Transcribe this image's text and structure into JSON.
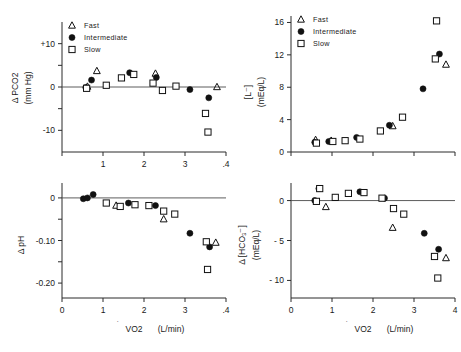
{
  "figure": {
    "title": "",
    "legend": [
      {
        "label": "Fast",
        "marker": "triangle-open"
      },
      {
        "label": "Intermediate",
        "marker": "circle-filled"
      },
      {
        "label": "Slow",
        "marker": "square-open"
      }
    ],
    "xlabel_main": "VO2",
    "xlabel_units": "(L/min)"
  },
  "chart_data": [
    {
      "id": "pco2",
      "type": "scatter",
      "title": "",
      "xlabel": "VO2 (L/min)",
      "ylabel": "Δ PCO2  (mm Hg)",
      "xlim": [
        0,
        4
      ],
      "ylim": [
        -15,
        15
      ],
      "xticks": [
        0,
        1,
        2,
        3,
        4
      ],
      "xticklabels": [
        "",
        "1",
        "2",
        "3",
        ".4"
      ],
      "yticks": [
        -10,
        -5,
        0,
        5,
        10
      ],
      "yticklabels": [
        "-10",
        "",
        "0",
        "",
        "+10"
      ],
      "grid": false,
      "zero_reference_line": 0,
      "legend_position": "top-left",
      "series": [
        {
          "name": "Fast",
          "marker": "triangle-open",
          "points": [
            [
              0.62,
              0.1
            ],
            [
              0.85,
              3.7
            ],
            [
              2.28,
              3.1
            ],
            [
              3.78,
              0.0
            ]
          ]
        },
        {
          "name": "Intermediate",
          "marker": "circle-filled",
          "points": [
            [
              0.58,
              -0.1
            ],
            [
              0.72,
              1.6
            ],
            [
              1.65,
              3.3
            ],
            [
              2.3,
              2.2
            ],
            [
              3.12,
              -0.6
            ],
            [
              3.58,
              -2.5
            ]
          ]
        },
        {
          "name": "Slow",
          "marker": "square-open",
          "points": [
            [
              0.6,
              -0.3
            ],
            [
              1.08,
              0.4
            ],
            [
              1.45,
              2.1
            ],
            [
              1.75,
              2.9
            ],
            [
              2.22,
              0.9
            ],
            [
              2.45,
              -0.8
            ],
            [
              2.78,
              0.2
            ],
            [
              3.5,
              -6.1
            ],
            [
              3.56,
              -10.4
            ]
          ]
        }
      ]
    },
    {
      "id": "lactate",
      "type": "scatter",
      "title": "",
      "xlabel": "VO2 (L/min)",
      "ylabel": "[L⁻]  (mEq/L)",
      "xlim": [
        0,
        4
      ],
      "ylim": [
        0,
        16.8
      ],
      "xticks": [
        0,
        1,
        2,
        3,
        4
      ],
      "xticklabels": [
        "",
        "",
        "",
        "",
        ""
      ],
      "yticks": [
        0,
        4,
        8,
        12,
        16
      ],
      "yticklabels": [
        "0",
        "4",
        "8",
        "12",
        "16"
      ],
      "grid": false,
      "legend_position": "top-left",
      "series": [
        {
          "name": "Fast",
          "marker": "triangle-open",
          "points": [
            [
              0.6,
              1.5
            ],
            [
              0.98,
              1.4
            ],
            [
              2.48,
              3.2
            ],
            [
              3.78,
              10.8
            ]
          ]
        },
        {
          "name": "Intermediate",
          "marker": "circle-filled",
          "points": [
            [
              0.58,
              1.2
            ],
            [
              0.92,
              1.3
            ],
            [
              1.6,
              1.8
            ],
            [
              2.4,
              3.3
            ],
            [
              3.22,
              7.8
            ],
            [
              3.62,
              12.1
            ]
          ]
        },
        {
          "name": "Slow",
          "marker": "square-open",
          "points": [
            [
              0.62,
              1.1
            ],
            [
              1.02,
              1.3
            ],
            [
              1.32,
              1.4
            ],
            [
              1.68,
              1.6
            ],
            [
              2.18,
              2.6
            ],
            [
              2.72,
              4.3
            ],
            [
              3.52,
              11.5
            ],
            [
              3.55,
              16.2
            ]
          ]
        }
      ]
    },
    {
      "id": "ph",
      "type": "scatter",
      "title": "",
      "xlabel": "VO2 (L/min)",
      "ylabel": "Δ pH",
      "xlim": [
        0,
        4
      ],
      "ylim": [
        -0.235,
        0.035
      ],
      "xticks": [
        0,
        1,
        2,
        3,
        4
      ],
      "xticklabels": [
        "0",
        "1",
        "2",
        "3",
        ".4"
      ],
      "yticks": [
        -0.2,
        -0.15,
        -0.1,
        -0.05,
        0
      ],
      "yticklabels": [
        "-0.20",
        "",
        "-0.10",
        "",
        "0"
      ],
      "grid": false,
      "zero_reference_line": 0,
      "series": [
        {
          "name": "Fast",
          "marker": "triangle-open",
          "points": [
            [
              1.32,
              -0.018
            ],
            [
              2.48,
              -0.05
            ],
            [
              3.75,
              -0.105
            ]
          ]
        },
        {
          "name": "Intermediate",
          "marker": "circle-filled",
          "points": [
            [
              0.52,
              -0.002
            ],
            [
              0.62,
              0.0
            ],
            [
              0.76,
              0.008
            ],
            [
              1.62,
              -0.012
            ],
            [
              2.28,
              -0.018
            ],
            [
              3.12,
              -0.083
            ],
            [
              3.6,
              -0.115
            ]
          ]
        },
        {
          "name": "Slow",
          "marker": "square-open",
          "points": [
            [
              1.08,
              -0.012
            ],
            [
              1.42,
              -0.02
            ],
            [
              1.78,
              -0.016
            ],
            [
              2.12,
              -0.018
            ],
            [
              2.48,
              -0.031
            ],
            [
              2.75,
              -0.038
            ],
            [
              3.52,
              -0.103
            ],
            [
              3.55,
              -0.168
            ]
          ]
        }
      ]
    },
    {
      "id": "hco3",
      "type": "scatter",
      "title": "",
      "xlabel": "VO2 (L/min)",
      "ylabel": "Δ [HCO₃⁻]  (mEq/L)",
      "xlim": [
        0,
        4
      ],
      "ylim": [
        -12.2,
        2.2
      ],
      "xticks": [
        0,
        1,
        2,
        3,
        4
      ],
      "xticklabels": [
        "0",
        "1",
        "2",
        "3",
        "4"
      ],
      "yticks": [
        -10,
        -5,
        0
      ],
      "yticklabels": [
        "- 10",
        "- 5",
        "0"
      ],
      "grid": false,
      "zero_reference_line": 0,
      "series": [
        {
          "name": "Fast",
          "marker": "triangle-open",
          "points": [
            [
              0.85,
              -0.8
            ],
            [
              2.48,
              -3.4
            ],
            [
              3.78,
              -7.2
            ]
          ]
        },
        {
          "name": "Intermediate",
          "marker": "circle-filled",
          "points": [
            [
              0.58,
              0.0
            ],
            [
              0.68,
              1.5
            ],
            [
              1.68,
              1.1
            ],
            [
              2.28,
              0.3
            ],
            [
              3.25,
              -4.1
            ],
            [
              3.6,
              -6.1
            ]
          ]
        },
        {
          "name": "Slow",
          "marker": "square-open",
          "points": [
            [
              0.62,
              -0.1
            ],
            [
              0.7,
              1.5
            ],
            [
              1.08,
              0.4
            ],
            [
              1.4,
              0.9
            ],
            [
              1.78,
              1.0
            ],
            [
              2.22,
              0.3
            ],
            [
              2.5,
              -1.0
            ],
            [
              2.75,
              -1.7
            ],
            [
              3.5,
              -7.0
            ],
            [
              3.58,
              -9.7
            ]
          ]
        }
      ]
    }
  ]
}
